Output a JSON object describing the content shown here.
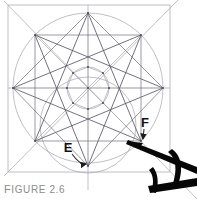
{
  "figure": {
    "caption": "FIGURE 2.6",
    "caption_first_letter": "F",
    "caption_rest": "IGURE 2.6",
    "caption_color": "#8c8c8c",
    "background_color": "#ffffff",
    "line_color": "#6b6b79",
    "construction_line_color": "#9a9aa6",
    "star_line_color": "#555563",
    "overlay_color": "#0a0a0a",
    "labels": [
      {
        "text": "E",
        "x": 68,
        "y": 148,
        "target_x": 88,
        "target_y": 166
      },
      {
        "text": "F",
        "x": 145,
        "y": 123,
        "target_x": 142,
        "target_y": 142
      }
    ]
  },
  "geometry": {
    "square": {
      "x": 8,
      "y": 5,
      "width": 162,
      "height": 167
    },
    "outer_circle": {
      "cx": 88,
      "cy": 88,
      "r": 75
    },
    "inner_circle": {
      "cx": 88,
      "cy": 88,
      "r": 21
    },
    "lower_circle": {
      "cx": 88,
      "cy": 125,
      "r": 48
    },
    "center": {
      "cx": 88,
      "cy": 88
    },
    "star_points": 8,
    "star_skip": 3,
    "star_vertices": [
      {
        "label": "top",
        "x": 88,
        "y": 13
      },
      {
        "label": "upper-right",
        "x": 141,
        "y": 35
      },
      {
        "label": "right",
        "x": 163,
        "y": 88
      },
      {
        "label": "lower-right",
        "x": 141,
        "y": 141
      },
      {
        "label": "bottom",
        "x": 88,
        "y": 166
      },
      {
        "label": "lower-left",
        "x": 35,
        "y": 141
      },
      {
        "label": "left",
        "x": 13,
        "y": 88
      },
      {
        "label": "upper-left",
        "x": 35,
        "y": 35
      }
    ],
    "inner_octagon_vertices": [
      {
        "x": 88,
        "y": 67
      },
      {
        "x": 103,
        "y": 73
      },
      {
        "x": 109,
        "y": 88
      },
      {
        "x": 103,
        "y": 103
      },
      {
        "x": 88,
        "y": 109
      },
      {
        "x": 73,
        "y": 103
      },
      {
        "x": 67,
        "y": 88
      },
      {
        "x": 73,
        "y": 73
      }
    ],
    "axes": [
      {
        "name": "horizontal-axis",
        "x1": 8,
        "y1": 88,
        "x2": 170,
        "y2": 88
      },
      {
        "name": "vertical-axis",
        "x1": 88,
        "y1": 5,
        "x2": 88,
        "y2": 190
      }
    ],
    "square_diagonals": [
      {
        "name": "diagonal-nw-se",
        "x1": 4,
        "y1": 1,
        "x2": 197,
        "y2": 199
      },
      {
        "name": "diagonal-ne-sw",
        "x1": 178,
        "y1": 0,
        "x2": 4,
        "y2": 176
      }
    ],
    "overlay_pen": {
      "name": "drafting-pen",
      "shaft": {
        "x1": 130,
        "y1": 141,
        "x2": 197,
        "y2": 172
      },
      "nib_x": 142,
      "nib_y": 142
    }
  }
}
